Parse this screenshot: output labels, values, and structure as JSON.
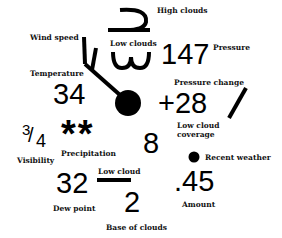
{
  "station": {
    "wind_speed": {
      "label": "Wind speed"
    },
    "high_clouds": {
      "label": "High clouds"
    },
    "low_clouds": {
      "label": "Low clouds"
    },
    "pressure": {
      "label": "Pressure",
      "value": "147"
    },
    "temperature": {
      "label": "Temperature",
      "value": "34"
    },
    "pressure_change": {
      "label": "Pressure change",
      "value": "+28"
    },
    "low_cloud_coverage": {
      "label_line1": "Low cloud",
      "label_line2": "coverage",
      "value": "8"
    },
    "visibility": {
      "label": "Visibility",
      "value_num": "3",
      "value_den": "4"
    },
    "precipitation": {
      "label": "Precipitation",
      "symbol": "**"
    },
    "recent_weather": {
      "label": "Recent weather"
    },
    "dew_point": {
      "label": "Dew point",
      "value": "32"
    },
    "low_cloud": {
      "label": "Low cloud"
    },
    "base_of_clouds": {
      "label": "Base of clouds",
      "value": "2"
    },
    "amount": {
      "label": "Amount",
      "value": ".45"
    }
  },
  "colors": {
    "ink": "#000000",
    "background": "#ffffff"
  }
}
